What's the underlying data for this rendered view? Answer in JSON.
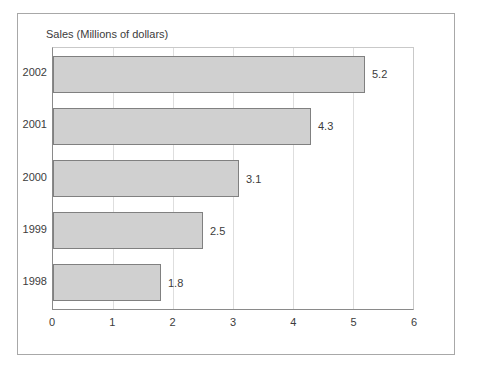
{
  "chart_data": {
    "type": "bar",
    "orientation": "horizontal",
    "title": "Sales (Millions of dollars)",
    "xlabel": "",
    "ylabel": "",
    "categories": [
      "2002",
      "2001",
      "2000",
      "1999",
      "1998"
    ],
    "values": [
      5.2,
      4.3,
      3.1,
      2.5,
      1.8
    ],
    "value_labels": [
      "5.2",
      "4.3",
      "3.1",
      "2.5",
      "1.8"
    ],
    "xlim": [
      0,
      6
    ],
    "xticks": [
      0,
      1,
      2,
      3,
      4,
      5,
      6
    ],
    "xtick_labels": [
      "0",
      "1",
      "2",
      "3",
      "4",
      "5",
      "6"
    ],
    "grid": true,
    "grid_axis": "x",
    "legend": false,
    "colors": {
      "bar_fill": "#d0d0d0",
      "bar_border": "#808080",
      "gridline": "#dedede",
      "axis": "#8a8a8a",
      "text": "#3c3c3c",
      "frame": "#a8a8a8",
      "background": "#ffffff"
    }
  }
}
